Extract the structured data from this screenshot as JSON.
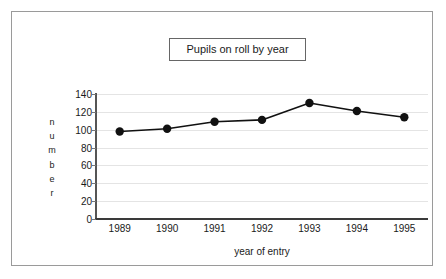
{
  "chart_data": {
    "type": "line",
    "title": "Pupils on roll by year",
    "xlabel": "year of entry",
    "ylabel": "number",
    "categories": [
      "1989",
      "1990",
      "1991",
      "1992",
      "1993",
      "1994",
      "1995"
    ],
    "values": [
      98,
      101,
      109,
      111,
      130,
      121,
      114
    ],
    "series": [
      {
        "name": "Pupils on roll",
        "values": [
          98,
          101,
          109,
          111,
          130,
          121,
          114
        ]
      }
    ],
    "ylim": [
      0,
      140
    ],
    "ytick_labels": [
      "140",
      "120",
      "100",
      "80",
      "60",
      "40",
      "20",
      "0"
    ],
    "ytick_values": [
      140,
      120,
      100,
      80,
      60,
      40,
      20,
      0
    ],
    "ylabel_letters": [
      "n",
      "u",
      "m",
      "b",
      "e",
      "r"
    ],
    "grid": true,
    "legend": false,
    "legend_position": "none",
    "marker": "circle",
    "line_color": "#111111",
    "marker_color": "#111111",
    "grid_color": "#e4e4e4",
    "axis_color": "#3a3a3a",
    "frame_color": "#9a9a9a",
    "background_color": "#ffffff"
  }
}
